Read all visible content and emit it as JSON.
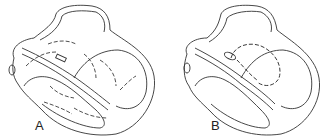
{
  "figure": {
    "panels": [
      {
        "id": "A",
        "label": "A",
        "description": "Heart cross-section with arrows showing widespread flow/conduction paths through both ventricles"
      },
      {
        "id": "B",
        "label": "B",
        "description": "Heart cross-section with dashed circular arrow path near the septum"
      }
    ]
  },
  "colors": {
    "line": "#333333",
    "background": "#ffffff"
  }
}
